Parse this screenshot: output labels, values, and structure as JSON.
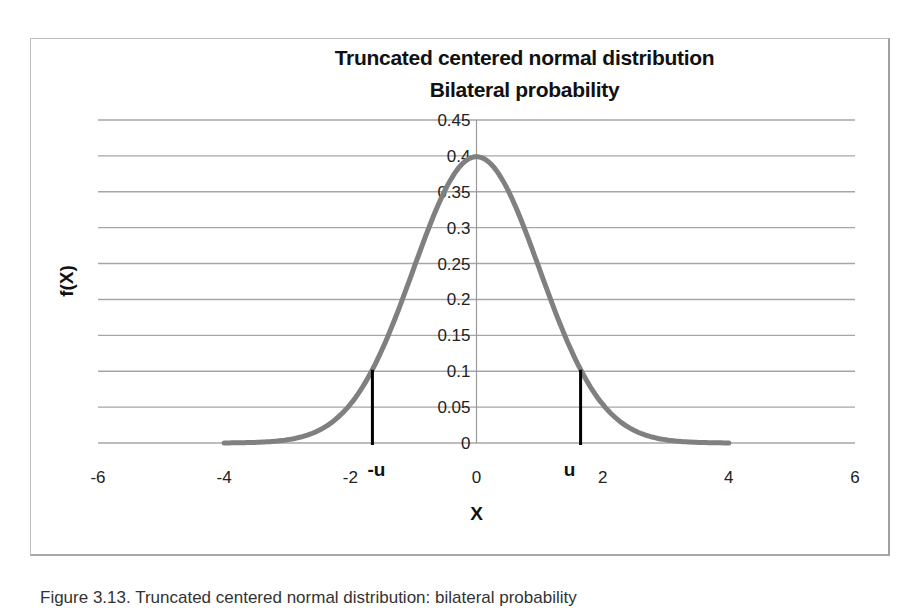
{
  "chart": {
    "title_line1": "Truncated centered normal distribution",
    "title_line2": "Bilateral probability",
    "xlabel": "X",
    "ylabel": "f(X)",
    "marker_left_label": "-u",
    "marker_right_label": "u",
    "y_ticks": [
      "0",
      "0.05",
      "0.1",
      "0.15",
      "0.2",
      "0.25",
      "0.3",
      "0.35",
      "0.4",
      "0.45"
    ],
    "x_ticks": [
      "-6",
      "-4",
      "-2",
      "0",
      "2",
      "4",
      "6"
    ],
    "curve_color": "#808080",
    "marker_color": "#000000",
    "gridline_color": "#a6a6a6"
  },
  "caption": "Figure 3.13. Truncated centered normal distribution: bilateral probability",
  "chart_data": {
    "type": "line",
    "xlabel": "X",
    "ylabel": "f(X)",
    "xlim": [
      -6,
      6
    ],
    "ylim": [
      0,
      0.45
    ],
    "x_ticks": [
      -6,
      -4,
      -2,
      0,
      2,
      4,
      6
    ],
    "y_ticks": [
      0,
      0.05,
      0.1,
      0.15,
      0.2,
      0.25,
      0.3,
      0.35,
      0.4,
      0.45
    ],
    "grid": "horizontal",
    "legend": "none",
    "series": [
      {
        "name": "f(X) standard normal density",
        "x": [
          -4,
          -3.5,
          -3,
          -2.5,
          -2,
          -1.5,
          -1,
          -0.5,
          0,
          0.5,
          1,
          1.5,
          2,
          2.5,
          3,
          3.5,
          4
        ],
        "values": [
          0.0001,
          0.0009,
          0.0044,
          0.0175,
          0.054,
          0.1295,
          0.242,
          0.3521,
          0.3989,
          0.3521,
          0.242,
          0.1295,
          0.054,
          0.0175,
          0.0044,
          0.0009,
          0.0001
        ]
      }
    ],
    "annotations": [
      {
        "label": "-u",
        "x": -1.65,
        "y_from": 0,
        "y_to": 0.102,
        "type": "vertical-line"
      },
      {
        "label": "u",
        "x": 1.65,
        "y_from": 0,
        "y_to": 0.102,
        "type": "vertical-line"
      }
    ]
  }
}
